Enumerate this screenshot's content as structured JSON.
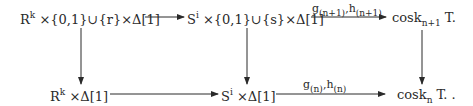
{
  "diagram": {
    "top_row": {
      "node1": {
        "base": "R",
        "dot": ".",
        "sup": "k",
        "rest": " ×{0,1}∪{r}×Δ[1]"
      },
      "node2": {
        "base": "S",
        "dot": ".",
        "sup": "i",
        "rest": " ×{0,1}∪{s}×Δ[1]"
      },
      "node3": {
        "base": "cosk",
        "sub": "n+1",
        "rest": " T."
      }
    },
    "bottom_row": {
      "node1": {
        "base": "R",
        "dot": ".",
        "sup": "k",
        "rest": " ×Δ[1]"
      },
      "node2": {
        "base": "S",
        "dot": ".",
        "sup": "i",
        "rest": " ×Δ[1]"
      },
      "node3": {
        "base": "cosk",
        "sub": "n",
        "rest": " T. ."
      }
    },
    "arrow_labels": {
      "top": {
        "g": "g",
        "g_sub": "(n+1)",
        "sep": ",",
        "h": "h",
        "h_sub": "(n+1)"
      },
      "bottom": {
        "g": "g",
        "g_sub": "(n)",
        "sep": ",",
        "h": "h",
        "h_sub": "(n)"
      }
    },
    "colors": {
      "ink": "#2a2a2a"
    }
  }
}
